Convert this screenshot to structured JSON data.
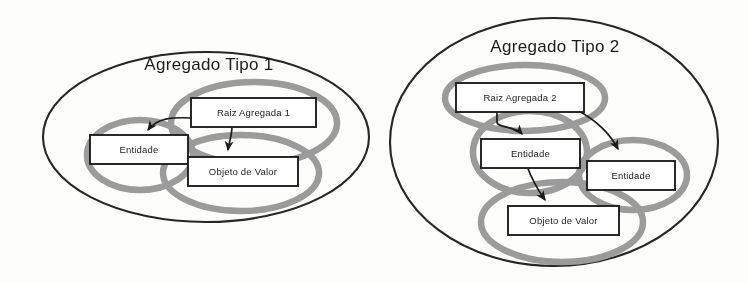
{
  "figure": {
    "background_color": "#fdfdfb",
    "outer_ellipse_color": "#252525",
    "ring_color": "#9b9b9b",
    "box_fill": "#ffffff",
    "box_border_color": "#1f1f1f",
    "arrow_color": "#1a1a1a",
    "text_color": "#1c1c1c"
  },
  "diagrams": [
    {
      "id": "aggregate-type-1",
      "title": "Agregado Tipo 1",
      "boxes": [
        {
          "id": "raiz-agregada-1",
          "label": "Raiz Agregada 1"
        },
        {
          "id": "entidade-1",
          "label": "Entidade"
        },
        {
          "id": "objeto-de-valor-1",
          "label": "Objeto de Valor"
        }
      ],
      "rings": 3,
      "arrows": [
        {
          "from": "raiz-agregada-1",
          "to": "entidade-1"
        },
        {
          "from": "raiz-agregada-1",
          "to": "objeto-de-valor-1"
        }
      ]
    },
    {
      "id": "aggregate-type-2",
      "title": "Agregado Tipo 2",
      "boxes": [
        {
          "id": "raiz-agregada-2",
          "label": "Raiz Agregada 2"
        },
        {
          "id": "entidade-2a",
          "label": "Entidade"
        },
        {
          "id": "entidade-2b",
          "label": "Entidade"
        },
        {
          "id": "objeto-de-valor-2",
          "label": "Objeto de Valor"
        }
      ],
      "rings": 4,
      "arrows": [
        {
          "from": "raiz-agregada-2",
          "to": "entidade-2a"
        },
        {
          "from": "raiz-agregada-2",
          "to": "entidade-2b"
        },
        {
          "from": "entidade-2a",
          "to": "objeto-de-valor-2"
        }
      ]
    }
  ]
}
